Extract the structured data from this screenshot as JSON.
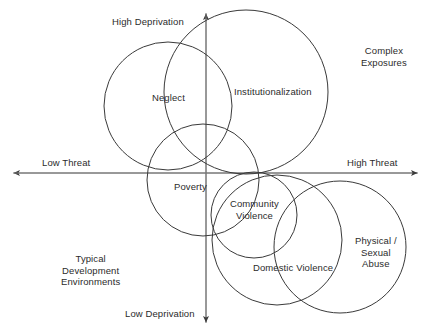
{
  "figure": {
    "type": "quadrant-diagram",
    "title": "",
    "background_color": "#ffffff",
    "stroke_color": "#3a3a3a",
    "text_color": "#2b2b2b",
    "width": 429,
    "height": 333
  },
  "axes": {
    "horizontal": {
      "left_label": "Low Threat",
      "right_label": "High Threat",
      "y": 173,
      "x_start": 13,
      "x_end": 418,
      "double_arrow": true
    },
    "vertical": {
      "top_label": "High Deprivation",
      "bottom_label": "Low Deprivation",
      "x": 206,
      "y_start": 13,
      "y_end": 323,
      "double_arrow": true
    }
  },
  "quadrant_labels": [
    {
      "name": "complex-exposures",
      "lines": [
        "Complex",
        "Exposures"
      ],
      "x": 384,
      "y": 56
    },
    {
      "name": "typical-development-environments",
      "lines": [
        "Typical",
        "Development",
        "Environments"
      ],
      "x": 90,
      "y": 270
    }
  ],
  "circles": [
    {
      "name": "neglect",
      "label": "Neglect",
      "label_lines": [
        "Neglect"
      ],
      "cx": 168,
      "cy": 106,
      "r": 64,
      "label_x": 168,
      "label_y": 98
    },
    {
      "name": "institutionalization",
      "label": "Institutionalization",
      "label_lines": [
        "Institutionalization"
      ],
      "cx": 246,
      "cy": 92,
      "r": 82,
      "label_x": 273,
      "label_y": 92
    },
    {
      "name": "poverty",
      "label": "Poverty",
      "label_lines": [
        "Poverty"
      ],
      "cx": 203,
      "cy": 180,
      "r": 56,
      "label_x": 190,
      "label_y": 187
    },
    {
      "name": "community-violence",
      "label": "Community Violence",
      "label_lines": [
        "Community",
        "Violence"
      ],
      "cx": 254,
      "cy": 215,
      "r": 43,
      "label_x": 254,
      "label_y": 209
    },
    {
      "name": "domestic-violence",
      "label": "Domestic Violence",
      "label_lines": [
        "Domestic Violence"
      ],
      "cx": 277,
      "cy": 240,
      "r": 65,
      "label_x": 293,
      "label_y": 268
    },
    {
      "name": "physical-sexual-abuse",
      "label": "Physical / Sexual Abuse",
      "label_lines": [
        "Physical /",
        "Sexual",
        "Abuse"
      ],
      "cx": 340,
      "cy": 247,
      "r": 66,
      "label_x": 376,
      "label_y": 252
    }
  ],
  "chart_data": {
    "type": "scatter",
    "title": "",
    "xlabel": "Threat",
    "ylabel": "Deprivation",
    "x_axis_ticks": [
      "Low Threat",
      "High Threat"
    ],
    "y_axis_ticks": [
      "Low Deprivation",
      "High Deprivation"
    ],
    "grid": false,
    "legend": "none",
    "annotations": [
      "Complex Exposures",
      "Typical Development Environments"
    ],
    "categories": [
      "Neglect",
      "Institutionalization",
      "Poverty",
      "Community Violence",
      "Domestic Violence",
      "Physical / Sexual Abuse"
    ],
    "points": [
      {
        "label": "Neglect",
        "threat": -0.19,
        "deprivation": 0.43,
        "size": 64
      },
      {
        "label": "Institutionalization",
        "threat": 0.2,
        "deprivation": 0.52,
        "size": 82
      },
      {
        "label": "Poverty",
        "threat": -0.01,
        "deprivation": 0.04,
        "size": 56
      },
      {
        "label": "Community Violence",
        "threat": 0.24,
        "deprivation": -0.27,
        "size": 43
      },
      {
        "label": "Domestic Violence",
        "threat": 0.35,
        "deprivation": -0.43,
        "size": 65
      },
      {
        "label": "Physical / Sexual Abuse",
        "threat": 0.66,
        "deprivation": -0.48,
        "size": 66
      }
    ]
  }
}
